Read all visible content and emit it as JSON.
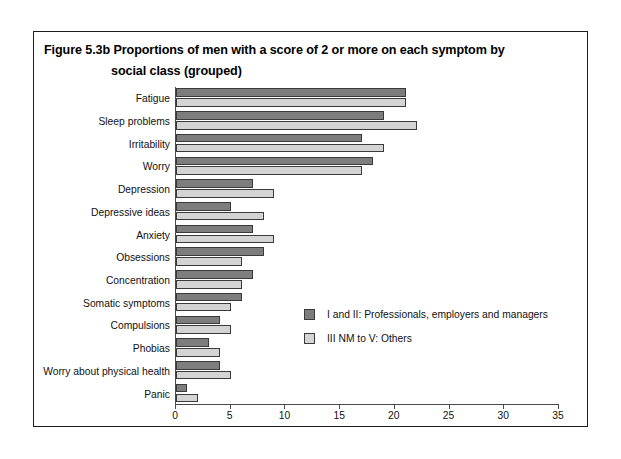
{
  "figure": {
    "title_line1": "Figure 5.3b  Proportions of men with a score of 2 or more on each symptom by",
    "title_line2": "social class (grouped)"
  },
  "chart_data": {
    "type": "bar",
    "orientation": "horizontal",
    "title": "Figure 5.3b  Proportions of men with a score of 2 or more on each symptom by social class (grouped)",
    "xlabel": "",
    "ylabel": "",
    "xlim": [
      0,
      35
    ],
    "xticks": [
      0,
      5,
      10,
      15,
      20,
      25,
      30,
      35
    ],
    "grid": false,
    "legend_position": "center-right",
    "categories": [
      "Fatigue",
      "Sleep problems",
      "Irritability",
      "Worry",
      "Depression",
      "Depressive ideas",
      "Anxiety",
      "Obsessions",
      "Concentration",
      "Somatic symptoms",
      "Compulsions",
      "Phobias",
      "Worry about physical health",
      "Panic"
    ],
    "series": [
      {
        "name": "I and II: Professionals, employers and managers",
        "color": "#7d7d7d",
        "values": [
          21,
          19,
          17,
          18,
          7,
          5,
          7,
          8,
          7,
          6,
          4,
          3,
          4,
          1
        ]
      },
      {
        "name": "III NM to V: Others",
        "color": "#d4d4d4",
        "values": [
          21,
          22,
          19,
          17,
          9,
          8,
          9,
          6,
          6,
          5,
          5,
          4,
          5,
          2
        ]
      }
    ]
  },
  "axis": {
    "tick_labels": [
      "0",
      "5",
      "10",
      "15",
      "20",
      "25",
      "30",
      "35"
    ]
  },
  "legend": {
    "entries": [
      {
        "label": "I and II: Professionals, employers and managers"
      },
      {
        "label": "III NM to V: Others"
      }
    ]
  }
}
